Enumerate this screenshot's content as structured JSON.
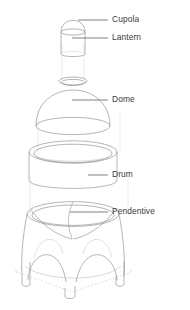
{
  "diagram": {
    "background_color": "#ffffff",
    "line_color": "#8d8d8d",
    "faint_line_color": "#d6d6d6",
    "leader_color": "#4a4a4a",
    "label_color": "#3b3b3b",
    "components": [
      {
        "id": "cupola",
        "label": "Cupola",
        "shape": "hemispherical-cap",
        "label_x": 112,
        "label_y": 20,
        "leader_from_x": 78,
        "leader_to_x": 108,
        "leader_y": 20
      },
      {
        "id": "lantern",
        "label": "Lantern",
        "shape": "cylinder",
        "label_x": 112,
        "label_y": 38,
        "leader_from_x": 72,
        "leader_to_x": 108,
        "leader_y": 38
      },
      {
        "id": "dome",
        "label": "Dome",
        "shape": "hemisphere-with-oculus",
        "label_x": 112,
        "label_y": 100,
        "leader_from_x": 72,
        "leader_to_x": 108,
        "leader_y": 100
      },
      {
        "id": "drum",
        "label": "Drum",
        "shape": "hollow-cylinder",
        "label_x": 112,
        "label_y": 175,
        "leader_from_x": 88,
        "leader_to_x": 108,
        "leader_y": 175
      },
      {
        "id": "pendentive",
        "label": "Pendentive",
        "shape": "four-arch-pendentive-base",
        "label_x": 112,
        "label_y": 212,
        "leader_from_x": 70,
        "leader_to_x": 108,
        "leader_y": 212
      }
    ]
  }
}
